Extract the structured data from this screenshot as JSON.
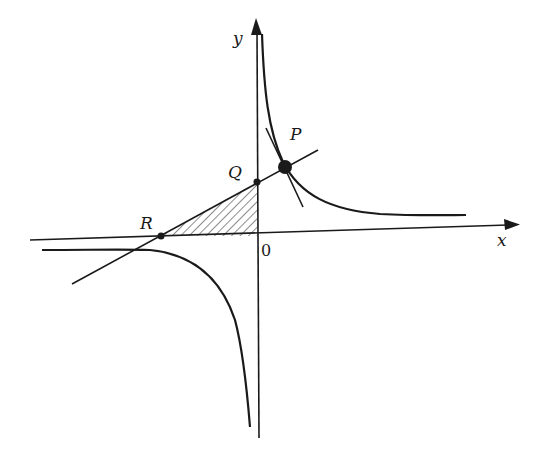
{
  "figure": {
    "type": "hyperbola-tangent-diagram",
    "axes": {
      "x_label": "x",
      "y_label": "y",
      "origin_label": "0"
    },
    "points": [
      {
        "name": "P",
        "label": "P",
        "description": "point of tangency on upper-right branch"
      },
      {
        "name": "Q",
        "label": "Q",
        "description": "intersection of tangent line with y-axis"
      },
      {
        "name": "R",
        "label": "R",
        "description": "intersection of tangent line with x-axis"
      }
    ],
    "curves": [
      {
        "name": "hyperbola-branch-first-quadrant"
      },
      {
        "name": "hyperbola-branch-third-quadrant"
      }
    ],
    "lines": [
      {
        "name": "tangent-line-through-P-Q-R"
      },
      {
        "name": "normal-line-through-P"
      }
    ],
    "shaded_region": {
      "name": "triangle-ROQ",
      "pattern": "diagonal hatching"
    },
    "colors": {
      "ink": "#1a1a1a",
      "background": "#ffffff"
    }
  }
}
